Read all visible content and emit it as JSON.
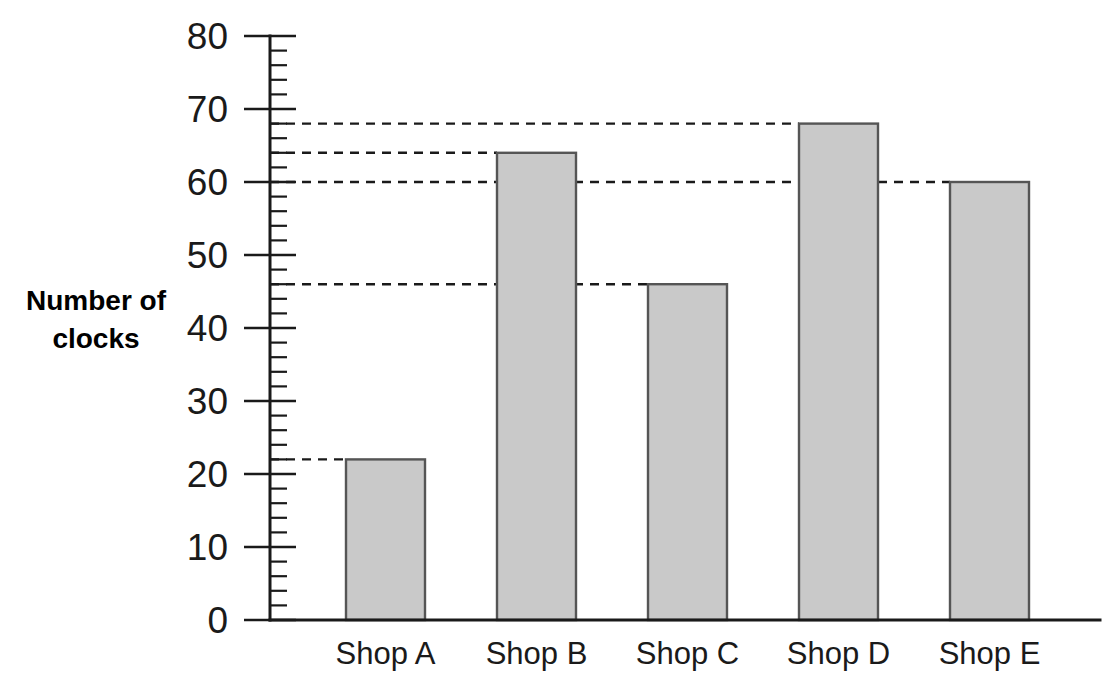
{
  "chart_data": {
    "type": "bar",
    "title": "",
    "xlabel": "",
    "ylabel": "Number of clocks",
    "categories": [
      "Shop A",
      "Shop B",
      "Shop C",
      "Shop D",
      "Shop E"
    ],
    "values": [
      22,
      64,
      46,
      68,
      60
    ],
    "ylim": [
      0,
      80
    ],
    "y_major_step": 10,
    "y_minor_step": 2,
    "y_tick_labels": [
      "0",
      "10",
      "20",
      "30",
      "40",
      "50",
      "60",
      "70",
      "80"
    ],
    "grid": false,
    "legend": false,
    "guide_lines": [
      22,
      46,
      64,
      68,
      60
    ],
    "bar_fill_color": "#c9c9c9",
    "bar_edge_color": "#555555",
    "axis_color": "#1a1a1a"
  },
  "axis": {
    "y_title_line1": "Number of",
    "y_title_line2": "clocks"
  },
  "bars": [
    {
      "label": "Shop A",
      "value": 22,
      "value_label": "22"
    },
    {
      "label": "Shop B",
      "value": 64,
      "value_label": "64"
    },
    {
      "label": "Shop C",
      "value": 46,
      "value_label": "46"
    },
    {
      "label": "Shop D",
      "value": 68,
      "value_label": "68"
    },
    {
      "label": "Shop E",
      "value": 60,
      "value_label": "60"
    }
  ]
}
